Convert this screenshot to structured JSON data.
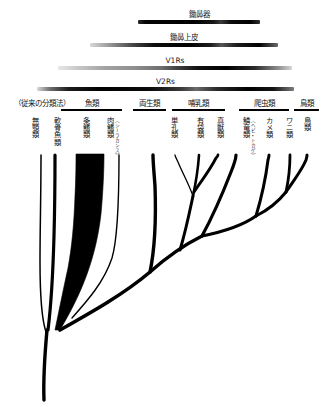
{
  "figure": {
    "type": "phylogenetic-tree",
    "title_visible": false,
    "background": "#ffffff",
    "ink": "#000000"
  },
  "distribution_bars": [
    {
      "id": "vomeronasal-organ",
      "label": "鋤鼻器",
      "left_pct": 43.0,
      "right_pct": 81.0,
      "note": "gradient bar, darkest mid-right"
    },
    {
      "id": "vomeronasal-epithelium",
      "label": "鋤鼻上皮",
      "left_pct": 28.0,
      "right_pct": 86.5,
      "note": "gradient bar fading at left edge"
    },
    {
      "id": "v1rs",
      "label": "V1Rs",
      "left_pct": 18.0,
      "right_pct": 91.0,
      "note": "light grey at left, black at right"
    },
    {
      "id": "v2rs",
      "label": "V2Rs",
      "left_pct": 11.5,
      "right_pct": 91.5,
      "note": "widest bar, dark through most of range"
    }
  ],
  "legacy_note": "（従来の分類法）",
  "groups": [
    {
      "id": "fish",
      "label": "魚類",
      "left_pct": 19.0,
      "right_pct": 38.0
    },
    {
      "id": "amphibia",
      "label": "両生類",
      "left_pct": 41.5,
      "right_pct": 51.5
    },
    {
      "id": "mammal",
      "label": "哺乳類",
      "left_pct": 53.5,
      "right_pct": 70.0
    },
    {
      "id": "reptile",
      "label": "爬虫類",
      "left_pct": 74.5,
      "right_pct": 90.0
    },
    {
      "id": "bird",
      "label": "鳥類",
      "left_pct": 91.5,
      "right_pct": 99.0
    }
  ],
  "taxa": [
    {
      "id": "agnatha",
      "label": "無顎類",
      "sub": "",
      "x_pct": 11.0
    },
    {
      "id": "chondrichthyes",
      "label": "軟骨魚類",
      "sub": "",
      "x_pct": 17.5
    },
    {
      "id": "actinopterygii",
      "label": "条鰭類",
      "sub": "",
      "x_pct": 27.0
    },
    {
      "id": "sarcopterygii",
      "label": "肉鰭類",
      "sub": "（シーラカンス）",
      "x_pct": 36.0
    },
    {
      "id": "monotremata",
      "label": "単孔類",
      "sub": "",
      "x_pct": 54.0
    },
    {
      "id": "marsupialia",
      "label": "有袋類",
      "sub": "",
      "x_pct": 62.0
    },
    {
      "id": "eutheria",
      "label": "真獣類",
      "sub": "",
      "x_pct": 68.5
    },
    {
      "id": "lepidosauria",
      "label": "鱗竜類",
      "sub": "（ヘビ・トカゲ）",
      "x_pct": 76.5
    },
    {
      "id": "testudines",
      "label": "カメ類",
      "sub": "",
      "x_pct": 83.5
    },
    {
      "id": "crocodylia",
      "label": "ワニ類",
      "sub": "",
      "x_pct": 89.5
    },
    {
      "id": "aves",
      "label": "鳥類",
      "sub": "",
      "x_pct": 95.5
    }
  ]
}
